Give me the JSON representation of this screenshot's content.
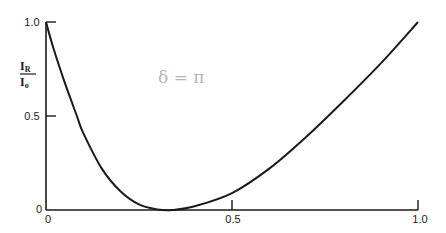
{
  "chart_data": {
    "type": "line",
    "title": "",
    "xlabel": "",
    "ylabel": "I_R / I_0",
    "ylabel_numerator": "I",
    "ylabel_numerator_sub": "R",
    "ylabel_denominator": "I",
    "ylabel_denominator_sub": "o",
    "xlim": [
      0,
      1.0
    ],
    "ylim": [
      0,
      1.0
    ],
    "grid": false,
    "legend": null,
    "x_ticks": [
      "0",
      "0.5",
      "1.0"
    ],
    "y_ticks": [
      "0",
      "0.5",
      "1.0"
    ],
    "annotation": "δ = π",
    "series": [
      {
        "name": "I_R/I_0",
        "x": [
          0,
          0.02,
          0.05,
          0.083,
          0.1,
          0.15,
          0.2,
          0.25,
          0.3,
          0.34,
          0.4,
          0.5,
          0.6,
          0.7,
          0.8,
          0.9,
          1.0
        ],
        "y": [
          1.0,
          0.86,
          0.68,
          0.5,
          0.41,
          0.22,
          0.1,
          0.03,
          0.003,
          0.0,
          0.02,
          0.09,
          0.22,
          0.39,
          0.58,
          0.78,
          1.0
        ]
      }
    ]
  },
  "colors": {
    "line": "#1a1a1a",
    "annotation": "#b5b5b5"
  }
}
